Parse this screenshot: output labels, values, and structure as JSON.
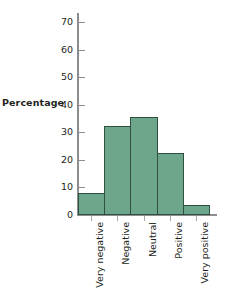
{
  "chart_data": {
    "type": "bar",
    "title": "",
    "subtitle": "",
    "xlabel": "",
    "ylabel": "Percentage",
    "categories": [
      "Very negative",
      "Negative",
      "Neutral",
      "Positive",
      "Very positive"
    ],
    "values": [
      8,
      32.5,
      35.5,
      22.5,
      3.5
    ],
    "ylim": [
      0,
      73
    ],
    "yticks": [
      0,
      10,
      20,
      30,
      40,
      50,
      60,
      70
    ],
    "ytick_labels": [
      "0",
      "10",
      "20",
      "30",
      "40",
      "50",
      "60",
      "70"
    ],
    "grid": false,
    "legend": null,
    "bar_fill_color": "#6da68a",
    "bar_edge_color": "#2f4f41",
    "axis_color": "#8d8d8d",
    "text_color": "#231f20"
  }
}
